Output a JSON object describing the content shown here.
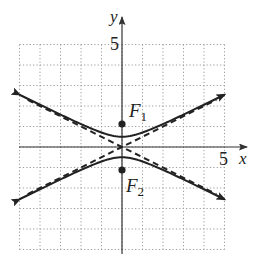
{
  "figure": {
    "type": "hyperbola",
    "equation": "y^2/0.25 - x^2/1 = 1",
    "axes": {
      "x_label": "x",
      "y_label": "y",
      "x_tick_label": "5",
      "y_tick_label": "5",
      "xlim": [
        -5,
        5
      ],
      "ylim": [
        -5,
        5
      ],
      "grid": true,
      "grid_step": 1
    },
    "foci": [
      {
        "name": "F1",
        "label_main": "F",
        "label_sub": "1",
        "x": 0,
        "y": 1.12
      },
      {
        "name": "F2",
        "label_main": "F",
        "label_sub": "2",
        "x": 0,
        "y": -1.12
      }
    ],
    "vertices": [
      [
        0,
        0.5
      ],
      [
        0,
        -0.5
      ]
    ],
    "asymptotes": [
      "y = 0.5x",
      "y = -0.5x"
    ],
    "colors": {
      "curve": "#222222",
      "grid": "#9a9a9a",
      "axis": "#333333"
    }
  }
}
